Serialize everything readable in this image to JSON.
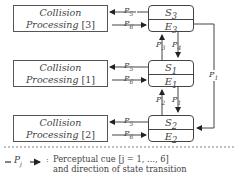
{
  "diagram": {
    "processes": [
      {
        "title": "Collision",
        "subtitle": "Processing",
        "index": "[3]"
      },
      {
        "title": "Collision",
        "subtitle": "Processing",
        "index": "[1]"
      },
      {
        "title": "Collision",
        "subtitle": "Processing",
        "index": "[2]"
      }
    ],
    "states": [
      {
        "s": "S",
        "s_sub": "3",
        "e": "E",
        "e_sub": "3"
      },
      {
        "s": "S",
        "s_sub": "1",
        "e": "E",
        "e_sub": "1"
      },
      {
        "s": "S",
        "s_sub": "2",
        "e": "E",
        "e_sub": "2"
      }
    ],
    "cues": {
      "p5": "P",
      "p5_sub": "5",
      "p6": "P",
      "p6_sub": "6",
      "p3": "P",
      "p3_sub": "3",
      "p4": "P",
      "p4_sub": "4",
      "p2": "P",
      "p2_sub": "2",
      "p1": "P",
      "p1_sub": "1",
      "pf": "P",
      "pf_sub": "1"
    },
    "legend": {
      "symbol": "P",
      "symbol_sub": "j",
      "colon": ":",
      "line1": "Perceptual cue [j = 1, ..., 6]",
      "line2": "and direction of state transition"
    }
  }
}
